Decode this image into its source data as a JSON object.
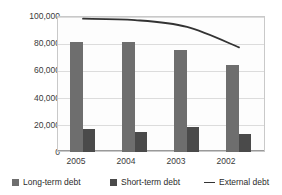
{
  "chart_data": {
    "type": "bar",
    "title": "",
    "subtitle": "",
    "xlabel": "",
    "ylabel": "",
    "categories": [
      "2005",
      "2004",
      "2003",
      "2002"
    ],
    "ylim": [
      0,
      100000
    ],
    "yticks": [
      100000,
      80000,
      60000,
      40000,
      20000,
      0
    ],
    "ytick_labels": [
      "100,000",
      "80,000",
      "60,000",
      "40,000",
      "20,000",
      "0"
    ],
    "grid": true,
    "legend_position": "bottom",
    "series": [
      {
        "name": "Long-term debt",
        "type": "bar",
        "color": "#6e6e6e",
        "values": [
          81000,
          81000,
          75000,
          64000
        ]
      },
      {
        "name": "Short-term debt",
        "type": "bar",
        "color": "#4a4a4a",
        "values": [
          17000,
          15000,
          18500,
          13500
        ]
      },
      {
        "name": "External debt",
        "type": "line",
        "color": "#333333",
        "values": [
          98000,
          97000,
          92000,
          77000
        ]
      }
    ]
  },
  "legend": {
    "items": [
      {
        "label": "Long-term debt",
        "marker": "square-swatch-icon"
      },
      {
        "label": "Short-term debt",
        "marker": "square-swatch-icon"
      },
      {
        "label": "External debt",
        "marker": "line-dash-icon"
      }
    ]
  }
}
